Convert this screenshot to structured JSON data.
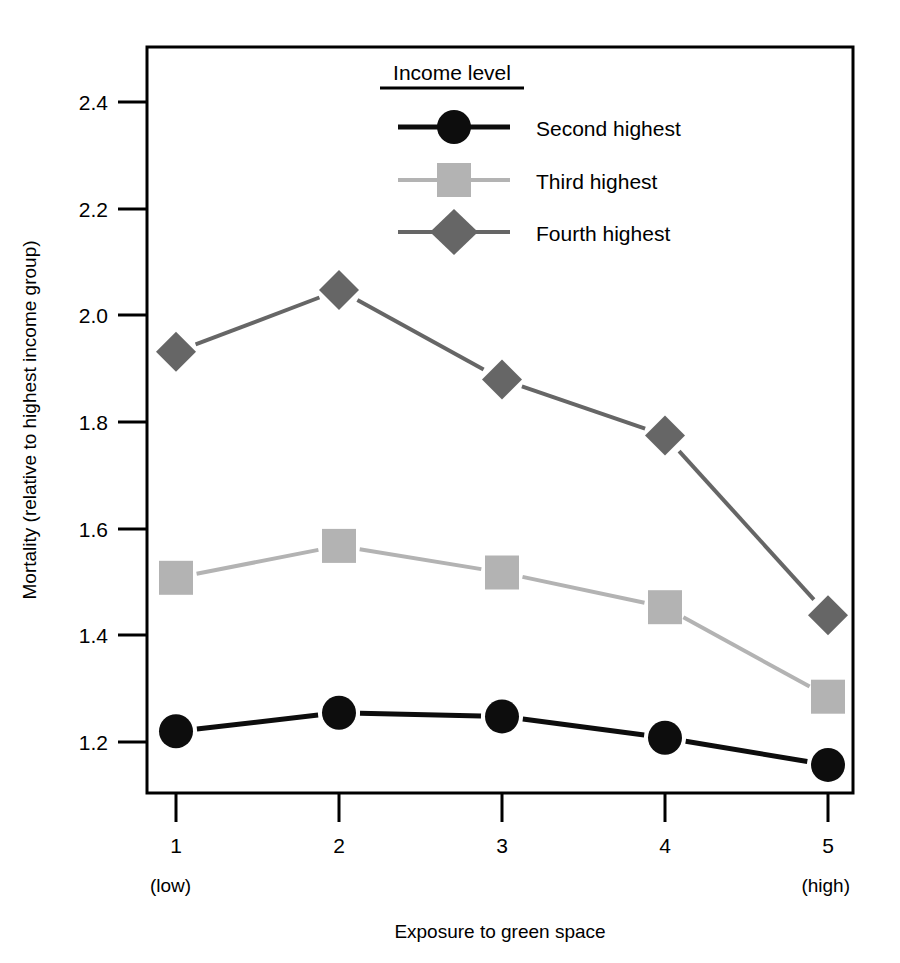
{
  "chart_data": {
    "type": "line",
    "title": "",
    "xlabel": "Exposure to green space",
    "ylabel": "Mortality (relative to highest income group)",
    "x": [
      1,
      2,
      3,
      4,
      5
    ],
    "categories": [
      "1",
      "2",
      "3",
      "4",
      "5"
    ],
    "xtick_labels": [
      "1",
      "2",
      "3",
      "4",
      "5"
    ],
    "xtick_sublabels": {
      "first": "(low)",
      "last": "(high)"
    },
    "ytick_labels": [
      "1.2",
      "1.4",
      "1.6",
      "1.8",
      "2.0",
      "2.2",
      "2.4"
    ],
    "ytick_values": [
      1.2,
      1.4,
      1.6,
      1.8,
      2.0,
      2.2,
      2.4
    ],
    "ylim": [
      1.11,
      2.52
    ],
    "xlim": [
      0.82,
      5.0
    ],
    "grid": false,
    "legend_position": "top-center",
    "legend_title": "Income level",
    "series": [
      {
        "name": "Second highest",
        "marker": "circle",
        "color": "#0d0d0d",
        "values": [
          1.22,
          1.255,
          1.248,
          1.208,
          1.157
        ]
      },
      {
        "name": "Third highest",
        "marker": "square",
        "color": "#b3b3b3",
        "values": [
          1.508,
          1.568,
          1.518,
          1.453,
          1.285
        ]
      },
      {
        "name": "Fourth highest",
        "marker": "diamond",
        "color": "#666666",
        "values": [
          1.932,
          2.048,
          1.88,
          1.775,
          1.438
        ]
      }
    ]
  },
  "legend": {
    "title": "Income level",
    "entries": [
      {
        "label": "Second highest",
        "marker": "circle-marker",
        "color": "#0d0d0d"
      },
      {
        "label": "Third highest",
        "marker": "square-marker",
        "color": "#b3b3b3"
      },
      {
        "label": "Fourth highest",
        "marker": "diamond-marker",
        "color": "#666666"
      }
    ]
  },
  "axes": {
    "y_title": "Mortality (relative to highest income group)",
    "x_title": "Exposure to green space",
    "y_ticks": [
      "1.2",
      "1.4",
      "1.6",
      "1.8",
      "2.0",
      "2.2",
      "2.4"
    ],
    "x_ticks": [
      "1",
      "2",
      "3",
      "4",
      "5"
    ],
    "x_low_note": "(low)",
    "x_high_note": "(high)"
  }
}
